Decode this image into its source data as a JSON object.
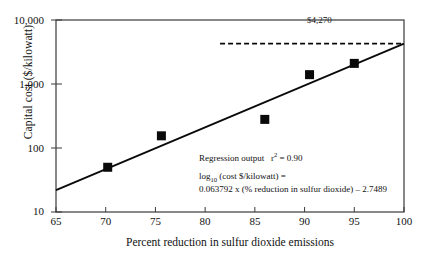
{
  "chart_data": {
    "type": "scatter",
    "title": "",
    "xlabel": "Percent reduction in sulfur dioxide emissions",
    "ylabel": "Capital cost ($/kilowatt)",
    "xlim": [
      65,
      100
    ],
    "ylim": [
      10,
      10000
    ],
    "yscale": "log",
    "grid": false,
    "legend": null,
    "xticks": [
      "65",
      "70",
      "75",
      "80",
      "85",
      "90",
      "95",
      "100"
    ],
    "xtick_values": [
      65,
      70,
      75,
      80,
      85,
      90,
      95,
      100
    ],
    "yticks": [
      "10",
      "100",
      "1,000",
      "10,000"
    ],
    "ytick_values": [
      10,
      100,
      1000,
      10000
    ],
    "points": [
      {
        "x": 70.2,
        "y": 50
      },
      {
        "x": 75.6,
        "y": 155
      },
      {
        "x": 86.0,
        "y": 280
      },
      {
        "x": 90.5,
        "y": 1400
      },
      {
        "x": 95.0,
        "y": 2100
      }
    ],
    "fit_line": {
      "style": "solid",
      "x_start": 65,
      "x_end": 100,
      "y_start": 22,
      "y_end": 4270
    },
    "reference_line": {
      "style": "dashed",
      "value": 4270,
      "label": "$4,270",
      "x_start": 81.5,
      "x_end": 100
    },
    "annotations": {
      "value_label": "$4,270",
      "regression_heading": "Regression output",
      "r_squared_label": "r",
      "r_squared_exp": "2",
      "r_squared_value": "= 0.90",
      "equation_lhs_log": "log",
      "equation_lhs_sub": "10",
      "equation_lhs_rest": "(cost $/kilowatt) =",
      "equation_rhs": "0.063792 x (% reduction in sulfur dioxide) – 2.7489"
    }
  },
  "axes": {
    "y_title": "Capital cost ($/kilowatt)",
    "x_title": "Percent reduction in sulfur dioxide emissions"
  },
  "colors": {
    "frame": "#3a3a3a",
    "marker": "#0a0a0a",
    "line": "#0a0a0a",
    "text": "#111111",
    "background": "#ffffff"
  }
}
